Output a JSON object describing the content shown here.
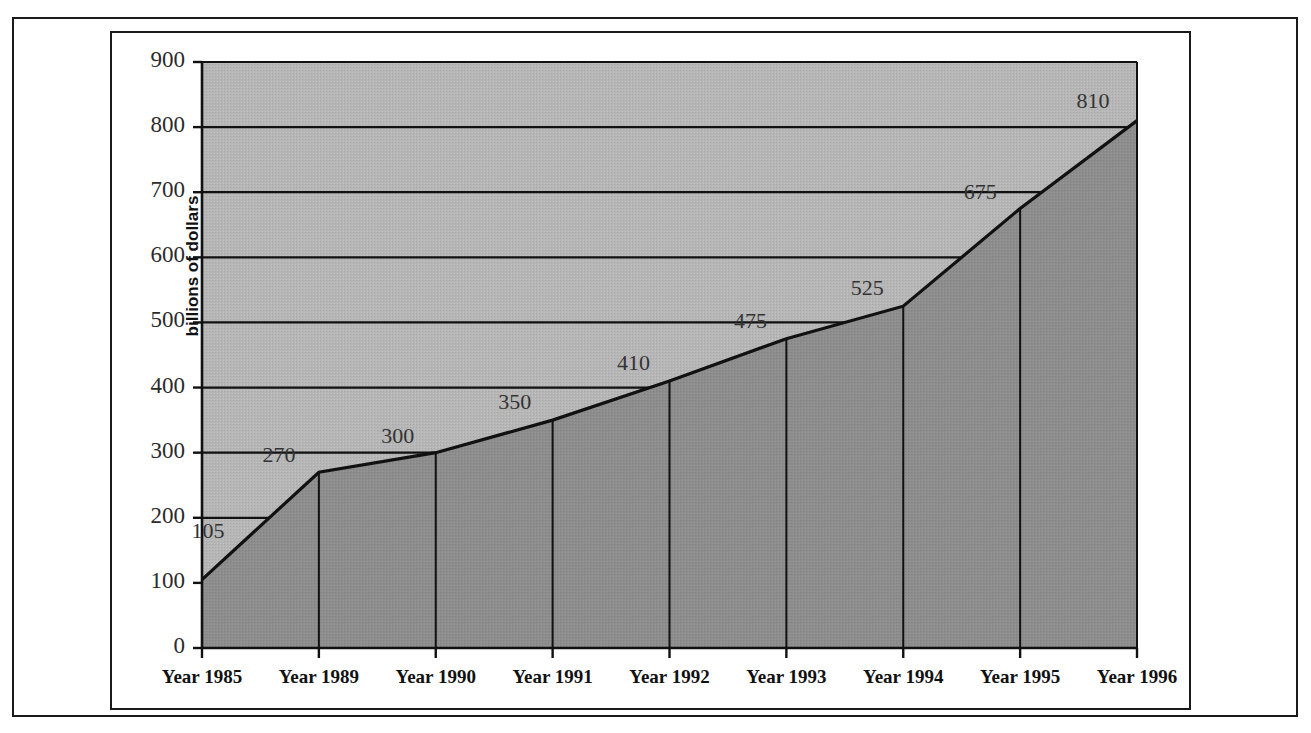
{
  "chart_data": {
    "type": "area",
    "title": "",
    "xlabel": "",
    "ylabel": "billions of dollars",
    "categories": [
      "Year 1985",
      "Year 1989",
      "Year 1990",
      "Year 1991",
      "Year 1992",
      "Year 1993",
      "Year 1994",
      "Year 1995",
      "Year 1996"
    ],
    "values": [
      105,
      270,
      300,
      350,
      410,
      475,
      525,
      675,
      810
    ],
    "point_labels": [
      "105",
      "270",
      "300",
      "350",
      "410",
      "475",
      "525",
      "675",
      "810"
    ],
    "ylim": [
      0,
      900
    ],
    "yticks": [
      0,
      100,
      200,
      300,
      400,
      500,
      600,
      700,
      800,
      900
    ],
    "ytick_labels": [
      "0",
      "100",
      "200",
      "300",
      "400",
      "500",
      "600",
      "700",
      "800",
      "900"
    ],
    "grid": true,
    "legend": "none",
    "colors": {
      "area_below_line": "#8d8d8d",
      "area_above_line": "#b6b6b6",
      "line": "#111111",
      "axis": "#111111",
      "gridline": "#111111",
      "label_text": "#333333",
      "frame": "#1a1a1a",
      "background": "#ffffff"
    }
  },
  "axes": {
    "y_title": "billions of dollars"
  }
}
